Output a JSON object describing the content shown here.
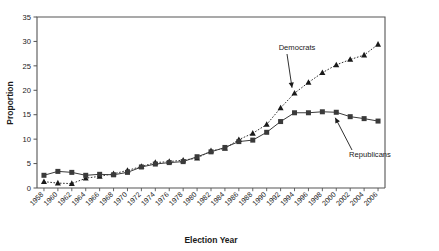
{
  "chart_data": {
    "type": "line",
    "title": "",
    "xlabel": "Election Year",
    "ylabel": "Proportion",
    "xlim": [
      1957,
      2007
    ],
    "ylim": [
      0,
      35
    ],
    "yticks": [
      0,
      5,
      10,
      15,
      20,
      25,
      30,
      35
    ],
    "grid": false,
    "legend_position": "inline-annotations",
    "categories": [
      1958,
      1960,
      1962,
      1964,
      1966,
      1968,
      1970,
      1972,
      1974,
      1976,
      1978,
      1980,
      1982,
      1984,
      1986,
      1988,
      1990,
      1992,
      1994,
      1996,
      1998,
      2000,
      2002,
      2004,
      2006
    ],
    "x": [
      1958,
      1960,
      1962,
      1964,
      1966,
      1968,
      1970,
      1972,
      1974,
      1976,
      1978,
      1980,
      1982,
      1984,
      1986,
      1988,
      1990,
      1992,
      1994,
      1996,
      1998,
      2000,
      2002,
      2004,
      2006
    ],
    "series": [
      {
        "name": "Republicans",
        "marker": "square",
        "linestyle": "solid",
        "color": "#3a3a3a",
        "values": [
          2.6,
          3.4,
          3.2,
          2.6,
          2.8,
          2.7,
          3.2,
          4.3,
          4.9,
          5.2,
          5.4,
          6.4,
          7.4,
          8.3,
          9.5,
          9.8,
          11.4,
          13.6,
          15.4,
          15.4,
          15.6,
          15.5,
          14.6,
          14.2,
          13.7
        ]
      },
      {
        "name": "Democrats",
        "marker": "triangle",
        "linestyle": "dotted",
        "color": "#1a1a1a",
        "values": [
          1.3,
          1.0,
          0.9,
          2.0,
          2.4,
          2.9,
          3.6,
          4.4,
          5.2,
          5.4,
          5.7,
          6.1,
          7.6,
          8.1,
          9.9,
          11.2,
          13.0,
          16.4,
          19.4,
          21.6,
          23.6,
          25.2,
          26.3,
          27.2,
          29.4
        ]
      }
    ],
    "annotations": [
      {
        "text": "Democrats",
        "target_x": 1994,
        "target_y": 19.4
      },
      {
        "text": "Republicans",
        "target_x": 2000,
        "target_y": 15.5
      }
    ]
  },
  "axis": {
    "ylabel": "Proportion",
    "xtitle": "Election Year",
    "ytick_labels": [
      "0",
      "5",
      "10",
      "15",
      "20",
      "25",
      "30",
      "35"
    ],
    "xtick_labels": [
      "1958",
      "1960",
      "1962",
      "1964",
      "1966",
      "1968",
      "1970",
      "1972",
      "1974",
      "1976",
      "1978",
      "1980",
      "1982",
      "1984",
      "1986",
      "1988",
      "1990",
      "1992",
      "1994",
      "1996",
      "1998",
      "2000",
      "2002",
      "2004",
      "2006"
    ]
  },
  "annotations": {
    "democrats_label": "Democrats",
    "republicans_label": "Republicans"
  },
  "colors": {
    "axis": "#555555",
    "republicans": "#3a3a3a",
    "democrats": "#1a1a1a",
    "background": "#ffffff"
  }
}
